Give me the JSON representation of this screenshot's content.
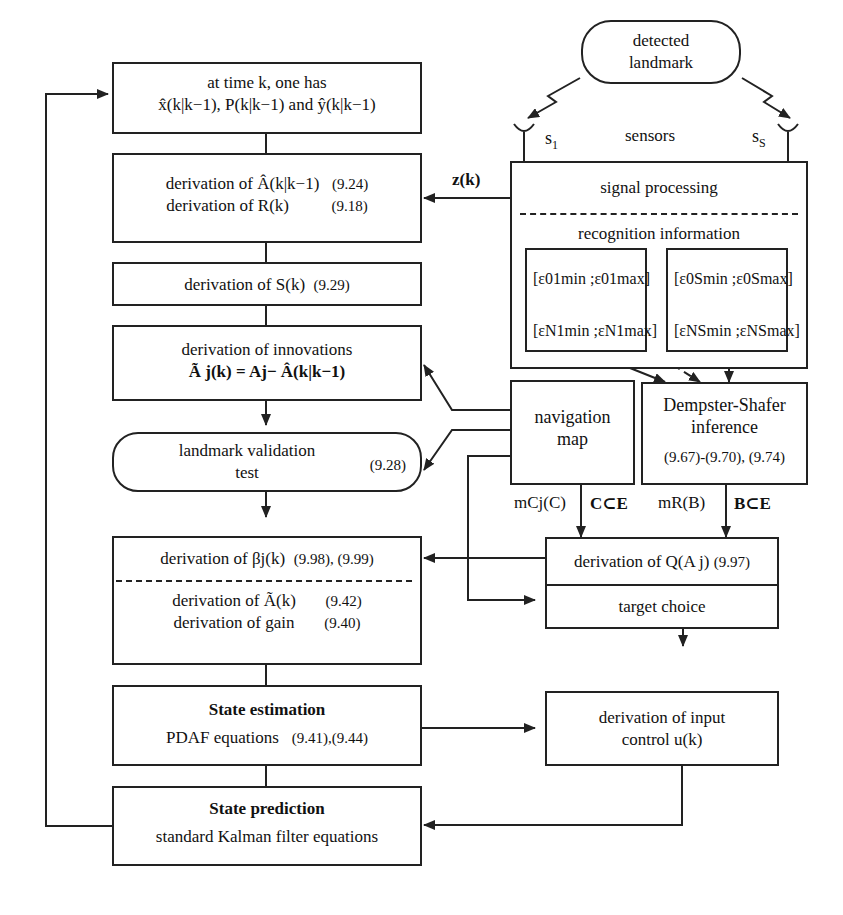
{
  "left_column": {
    "initial_box": {
      "line1": "at time k, one has",
      "line2": "x̂(k|k−1), P(k|k−1) and ŷ(k|k−1)"
    },
    "derivation_A_R": {
      "line1": "derivation of Â(k|k−1)",
      "eq1": "(9.24)",
      "line2": "derivation of R(k)",
      "eq2": "(9.18)"
    },
    "derivation_S": {
      "text": "derivation of S(k)",
      "eq": "(9.29)"
    },
    "innovations": {
      "line1": "derivation of innovations",
      "line2": "Ã j(k) = Aj− Â(k|k−1)"
    },
    "validation": {
      "line1": "landmark validation",
      "line2": "test",
      "eq": "(9.28)"
    },
    "beta_box": {
      "line1": "derivation of  βj(k)",
      "eq1": "(9.98), (9.99)",
      "line2": "derivation of Ã(k)",
      "eq2": "(9.42)",
      "line3": "derivation of gain",
      "eq3": "(9.40)"
    },
    "state_estimation": {
      "title": "State estimation",
      "text": "PDAF equations",
      "eq": "(9.41),(9.44)"
    },
    "state_prediction": {
      "title": "State prediction",
      "text": "standard Kalman filter equations"
    }
  },
  "right_column": {
    "landmark": {
      "line1": "detected",
      "line2": "landmark"
    },
    "sensors": {
      "label": "sensors",
      "s1": "s",
      "s1_sub": "1",
      "ss": "s",
      "ss_sub": "S"
    },
    "signal_processing": {
      "title": "signal processing",
      "recognition": "recognition information"
    },
    "epsilon": {
      "e01": "[ε01min ;ε01max]",
      "eN1": "[εN1min ;εN1max]",
      "e0S": "[ε0Smin ;ε0Smax]",
      "eNS": "[εNSmin ;εNSmax]"
    },
    "navigation_map": {
      "line1": "navigation",
      "line2": "map"
    },
    "dempster_shafer": {
      "line1": "Dempster-Shafer",
      "line2": "inference",
      "eq": "(9.67)-(9.70), (9.74)"
    },
    "mass_labels": {
      "mc": "mCj(C)",
      "c_subset": "C⊂E",
      "mr": "mR(B)",
      "b_subset": "B⊂E"
    },
    "derivation_Q": {
      "text": "derivation of Q(A j)",
      "eq": "(9.97)"
    },
    "target_choice": {
      "text": "target choice"
    },
    "input_control": {
      "line1": "derivation of input",
      "line2": "control u(k)"
    }
  },
  "edge_labels": {
    "zk": "z(k)"
  },
  "colors": {
    "ink": "#222222",
    "background": "#ffffff"
  }
}
